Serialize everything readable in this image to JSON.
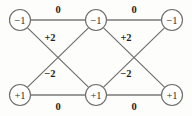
{
  "figure": {
    "name": "signed-bipartite-graph",
    "background_color": "#fdfdfc",
    "line_color": "#6d6d6d",
    "text_color": "#1f1f1f",
    "node_fill": "#ffffff"
  },
  "nodes": [
    {
      "id": "top-left",
      "label": "−1",
      "cx": 20,
      "cy": 20,
      "r": 10.5,
      "row": "top"
    },
    {
      "id": "top-center",
      "label": "−1",
      "cx": 96,
      "cy": 20,
      "r": 10.5,
      "row": "top"
    },
    {
      "id": "top-right",
      "label": "−1",
      "cx": 172,
      "cy": 20,
      "r": 10.5,
      "row": "top"
    },
    {
      "id": "bottom-left",
      "label": "+1",
      "cx": 20,
      "cy": 95,
      "r": 10.5,
      "row": "bottom"
    },
    {
      "id": "bottom-center",
      "label": "+1",
      "cx": 96,
      "cy": 95,
      "r": 10.5,
      "row": "bottom"
    },
    {
      "id": "bottom-right",
      "label": "+1",
      "cx": 172,
      "cy": 95,
      "r": 10.5,
      "row": "bottom"
    }
  ],
  "edges": [
    {
      "id": "edge-top-left-to-top-center",
      "from": "top-left",
      "to": "top-center",
      "weight": "0",
      "kind": "horizontal",
      "x1": 30.5,
      "y1": 20,
      "x2": 85.5,
      "y2": 20
    },
    {
      "id": "edge-top-center-to-top-right",
      "from": "top-center",
      "to": "top-right",
      "weight": "0",
      "kind": "horizontal",
      "x1": 106.5,
      "y1": 20,
      "x2": 161.5,
      "y2": 20
    },
    {
      "id": "edge-bottom-left-to-bottom-center",
      "from": "bottom-left",
      "to": "bottom-center",
      "weight": "0",
      "kind": "horizontal",
      "x1": 30.5,
      "y1": 95,
      "x2": 85.5,
      "y2": 95
    },
    {
      "id": "edge-bottom-center-to-bottom-right",
      "from": "bottom-center",
      "to": "bottom-right",
      "weight": "0",
      "kind": "horizontal",
      "x1": 106.5,
      "y1": 95,
      "x2": 161.5,
      "y2": 95
    },
    {
      "id": "edge-top-left-to-bottom-center",
      "from": "top-left",
      "to": "bottom-center",
      "weight": "+2",
      "kind": "diagonal",
      "x1": 27.8,
      "y1": 28.2,
      "x2": 88.2,
      "y2": 86.8
    },
    {
      "id": "edge-top-center-to-bottom-left",
      "from": "top-center",
      "to": "bottom-left",
      "weight": "−2",
      "kind": "diagonal",
      "x1": 88.2,
      "y1": 28.2,
      "x2": 27.8,
      "y2": 86.8
    },
    {
      "id": "edge-top-center-to-bottom-right",
      "from": "top-center",
      "to": "bottom-right",
      "weight": "+2",
      "kind": "diagonal",
      "x1": 103.8,
      "y1": 28.2,
      "x2": 164.2,
      "y2": 86.8
    },
    {
      "id": "edge-top-right-to-bottom-center",
      "from": "top-right",
      "to": "bottom-center",
      "weight": "−2",
      "kind": "diagonal",
      "x1": 164.2,
      "y1": 28.2,
      "x2": 103.8,
      "y2": 86.8
    }
  ],
  "edge_labels": [
    {
      "id": "label-top-left-0",
      "text": "0",
      "x": 58,
      "y": 9,
      "for_edge": "edge-top-left-to-top-center"
    },
    {
      "id": "label-top-right-0",
      "text": "0",
      "x": 134,
      "y": 9,
      "for_edge": "edge-top-center-to-top-right"
    },
    {
      "id": "label-bottom-left-0",
      "text": "0",
      "x": 58,
      "y": 106,
      "for_edge": "edge-bottom-left-to-bottom-center"
    },
    {
      "id": "label-bottom-right-0",
      "text": "0",
      "x": 134,
      "y": 106,
      "for_edge": "edge-bottom-center-to-bottom-right"
    },
    {
      "id": "label-left-plus2",
      "text": "+2",
      "x": 50,
      "y": 37,
      "for_edge": "edge-top-left-to-bottom-center"
    },
    {
      "id": "label-left-minus2",
      "text": "−2",
      "x": 50,
      "y": 73,
      "for_edge": "edge-top-center-to-bottom-left"
    },
    {
      "id": "label-right-plus2",
      "text": "+2",
      "x": 126,
      "y": 37,
      "for_edge": "edge-top-center-to-bottom-right"
    },
    {
      "id": "label-right-minus2",
      "text": "−2",
      "x": 126,
      "y": 73,
      "for_edge": "edge-top-right-to-bottom-center"
    }
  ]
}
